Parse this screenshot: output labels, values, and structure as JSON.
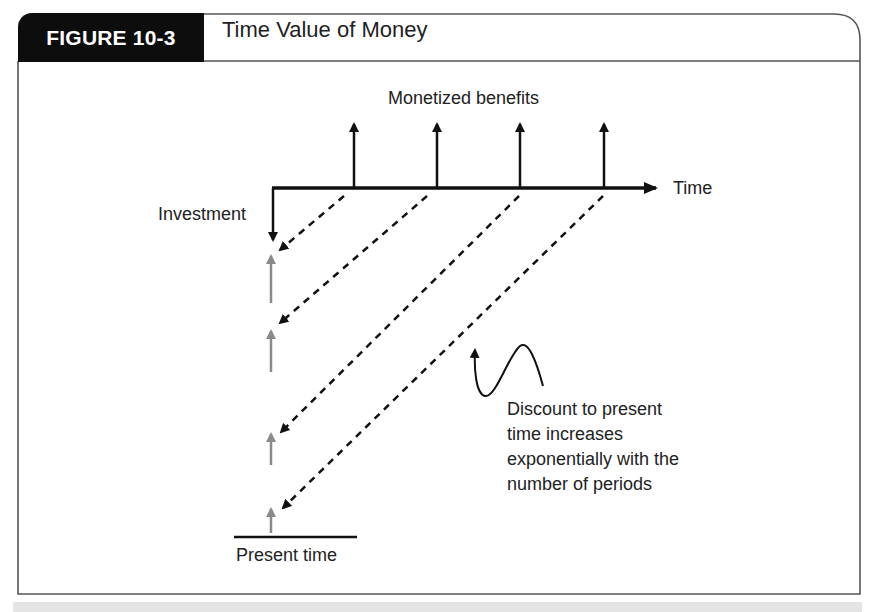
{
  "figure": {
    "tab_label": "FIGURE 10-3",
    "title": "Time Value of Money"
  },
  "diagram": {
    "labels": {
      "benefits": "Monetized benefits",
      "time_axis": "Time",
      "investment": "Investment",
      "present_time": "Present time"
    },
    "annotation": {
      "lines": [
        "Discount to present",
        "time increases",
        "exponentially with the",
        "number of periods"
      ]
    },
    "benefit_periods": 4,
    "discounted_values": 4,
    "colors": {
      "ink": "#111111",
      "discounted_arrow": "#8a8a8a",
      "tab_background": "#0d0d0d",
      "frame": "#555555"
    }
  }
}
